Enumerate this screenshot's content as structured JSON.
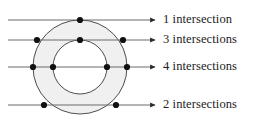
{
  "figure": {
    "background_color": "#ffffff",
    "stroke_color": "#3a3a3a",
    "annulus_fill_color": "#f0f0f0",
    "dot_color": "#111111",
    "text_color": "#1c1c1c"
  },
  "shapes": {
    "outer_circle": {
      "cx": 80,
      "cy": 67,
      "r": 47,
      "label": "outer-circle"
    },
    "inner_circle": {
      "cx": 80,
      "cy": 67,
      "r": 27,
      "label": "inner-circle"
    }
  },
  "lines": [
    {
      "id": "line-1",
      "y": 20,
      "x_start": 8,
      "x_end": 155,
      "label": "1 intersection",
      "label_x": 163,
      "count": 1,
      "dots_x": [
        80
      ]
    },
    {
      "id": "line-2",
      "y": 40,
      "x_start": 8,
      "x_end": 155,
      "label": "3 intersections",
      "label_x": 163,
      "count": 3,
      "dots_x": [
        37,
        80,
        123
      ]
    },
    {
      "id": "line-3",
      "y": 67,
      "x_start": 8,
      "x_end": 155,
      "label": "4 intersections",
      "label_x": 163,
      "count": 4,
      "dots_x": [
        33,
        53,
        107,
        127
      ]
    },
    {
      "id": "line-4",
      "y": 105,
      "x_start": 8,
      "x_end": 155,
      "label": "2 intersections",
      "label_x": 163,
      "count": 2,
      "dots_x": [
        44,
        116
      ]
    }
  ],
  "labels": {
    "row_1": "1 intersection",
    "row_2": "3 intersections",
    "row_3": "4 intersections",
    "row_4": "2 intersections"
  }
}
